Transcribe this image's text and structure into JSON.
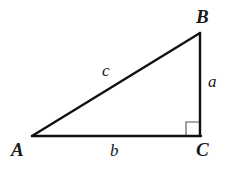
{
  "figure": {
    "kind": "right-triangle-diagram",
    "background_color": "#ffffff",
    "stroke_color": "#111111",
    "right_angle_marker_color": "#8a8a8a",
    "label_color": "#1a1a1a"
  },
  "vertices": [
    {
      "id": "A",
      "label": "A",
      "x": 32,
      "y": 136
    },
    {
      "id": "B",
      "label": "B",
      "x": 200,
      "y": 33
    },
    {
      "id": "C",
      "label": "C",
      "x": 200,
      "y": 136
    }
  ],
  "sides": [
    {
      "id": "a",
      "label": "a",
      "from": "B",
      "to": "C",
      "description": "vertical leg opposite vertex A"
    },
    {
      "id": "b",
      "label": "b",
      "from": "A",
      "to": "C",
      "description": "horizontal leg opposite vertex B"
    },
    {
      "id": "c",
      "label": "c",
      "from": "A",
      "to": "B",
      "description": "hypotenuse opposite vertex C"
    }
  ],
  "right_angle": {
    "at_vertex": "C",
    "marker_size": 14,
    "label": ""
  }
}
